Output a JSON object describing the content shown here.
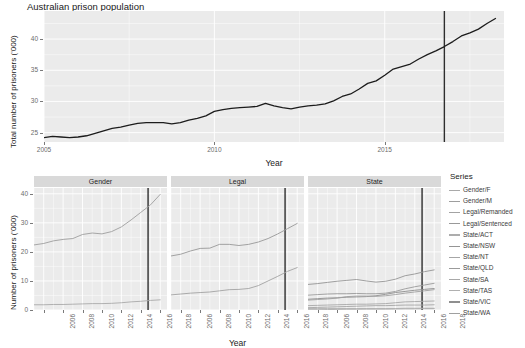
{
  "title": "Australian prison population",
  "top_chart": {
    "ylabel": "Total number of prisoners ('000)",
    "xlabel": "Year",
    "y_ticks": [
      "25",
      "30",
      "35",
      "40"
    ],
    "x_ticks": [
      "2005",
      "2010",
      "2015"
    ]
  },
  "facet_chart": {
    "ylabel": "Number of prisoners ('000)",
    "xlabel": "Year",
    "y_ticks": [
      "0",
      "10",
      "20",
      "30",
      "40"
    ],
    "x_ticks": [
      "2006",
      "2008",
      "2010",
      "2012",
      "2014",
      "2016",
      "2018"
    ],
    "strips": [
      "Gender",
      "Legal",
      "State"
    ]
  },
  "legend": {
    "title": "Series",
    "items": [
      {
        "label": "Gender/F",
        "color": "#a9a9a9"
      },
      {
        "label": "Gender/M",
        "color": "#9e9e9e"
      },
      {
        "label": "Legal/Remanded",
        "color": "#a3a3a3"
      },
      {
        "label": "Legal/Sentenced",
        "color": "#999999"
      },
      {
        "label": "State/ACT",
        "color": "#adadad"
      },
      {
        "label": "State/NSW",
        "color": "#959595"
      },
      {
        "label": "State/NT",
        "color": "#a6a6a6"
      },
      {
        "label": "State/QLD",
        "color": "#9b9b9b"
      },
      {
        "label": "State/SA",
        "color": "#a8a8a8"
      },
      {
        "label": "State/TAS",
        "color": "#b0b0b0"
      },
      {
        "label": "State/VIC",
        "color": "#8f8f8f"
      },
      {
        "label": "State/WA",
        "color": "#a0a0a0"
      }
    ]
  },
  "chart_data": {
    "type": "line",
    "title": "Australian prison population",
    "xlabel": "Year",
    "ylabel": "Total number of prisoners ('000)",
    "xlim": [
      2005.0,
      2018.5
    ],
    "ylim": [
      23.5,
      44.5
    ],
    "grid": true,
    "legend_position": "right",
    "panels": [
      {
        "name": "total",
        "role": "overview",
        "ylabel": "Total number of prisoners ('000)",
        "ylim": [
          23.5,
          44.5
        ],
        "y_ticks": [
          25,
          30,
          35,
          40
        ],
        "x_ticks": [
          2005,
          2010,
          2015
        ],
        "vline_x": 2016.75,
        "series": [
          {
            "name": "Total",
            "color": "#1c1c1c",
            "x": [
              2005.0,
              2005.25,
              2005.5,
              2005.75,
              2006.0,
              2006.25,
              2006.5,
              2006.75,
              2007.0,
              2007.25,
              2007.5,
              2007.75,
              2008.0,
              2008.25,
              2008.5,
              2008.75,
              2009.0,
              2009.25,
              2009.5,
              2009.75,
              2010.0,
              2010.25,
              2010.5,
              2010.75,
              2011.0,
              2011.25,
              2011.5,
              2011.75,
              2012.0,
              2012.25,
              2012.5,
              2012.75,
              2013.0,
              2013.25,
              2013.5,
              2013.75,
              2014.0,
              2014.25,
              2014.5,
              2014.75,
              2015.0,
              2015.25,
              2015.5,
              2015.75,
              2016.0,
              2016.25,
              2016.5,
              2016.75,
              2017.0,
              2017.25,
              2017.5,
              2017.75,
              2018.0,
              2018.25
            ],
            "y": [
              24.2,
              24.4,
              24.3,
              24.2,
              24.3,
              24.5,
              24.9,
              25.3,
              25.7,
              25.9,
              26.2,
              26.5,
              26.6,
              26.6,
              26.6,
              26.4,
              26.6,
              27.0,
              27.3,
              27.7,
              28.4,
              28.7,
              28.9,
              29.0,
              29.1,
              29.2,
              29.7,
              29.3,
              29.0,
              28.8,
              29.1,
              29.3,
              29.4,
              29.6,
              30.1,
              30.8,
              31.2,
              32.0,
              32.9,
              33.3,
              34.2,
              35.2,
              35.6,
              36.0,
              36.8,
              37.5,
              38.1,
              38.8,
              39.6,
              40.5,
              41.0,
              41.6,
              42.5,
              43.3
            ]
          }
        ]
      },
      {
        "name": "Gender",
        "ylim": [
          0,
          42
        ],
        "y_ticks": [
          0,
          10,
          20,
          30,
          40
        ],
        "x_ticks": [
          2006,
          2008,
          2010,
          2012,
          2014,
          2016,
          2018
        ],
        "vline_x": 2016.75,
        "series": [
          {
            "name": "Gender/M",
            "color": "#9e9e9e",
            "x": [
              2005,
              2006,
              2007,
              2008,
              2009,
              2010,
              2011,
              2012,
              2013,
              2014,
              2015,
              2016,
              2017,
              2018
            ],
            "y": [
              22.4,
              22.9,
              23.8,
              24.3,
              24.6,
              26.0,
              26.5,
              26.2,
              27.0,
              28.6,
              31.0,
              33.6,
              36.2,
              39.8
            ]
          },
          {
            "name": "Gender/F",
            "color": "#a9a9a9",
            "x": [
              2005,
              2006,
              2007,
              2008,
              2009,
              2010,
              2011,
              2012,
              2013,
              2014,
              2015,
              2016,
              2017,
              2018
            ],
            "y": [
              1.8,
              1.8,
              1.9,
              1.9,
              2.0,
              2.1,
              2.2,
              2.2,
              2.3,
              2.5,
              2.8,
              3.0,
              3.3,
              3.5
            ]
          }
        ]
      },
      {
        "name": "Legal",
        "ylim": [
          0,
          42
        ],
        "y_ticks": [
          0,
          10,
          20,
          30,
          40
        ],
        "x_ticks": [
          2006,
          2008,
          2010,
          2012,
          2014,
          2016,
          2018
        ],
        "vline_x": 2016.75,
        "series": [
          {
            "name": "Legal/Sentenced",
            "color": "#999999",
            "x": [
              2005,
              2006,
              2007,
              2008,
              2009,
              2010,
              2011,
              2012,
              2013,
              2014,
              2015,
              2016,
              2017,
              2018
            ],
            "y": [
              18.6,
              19.2,
              20.3,
              21.2,
              21.3,
              22.6,
              22.6,
              22.2,
              22.6,
              23.4,
              24.6,
              26.2,
              28.0,
              29.8
            ]
          },
          {
            "name": "Legal/Remanded",
            "color": "#a3a3a3",
            "x": [
              2005,
              2006,
              2007,
              2008,
              2009,
              2010,
              2011,
              2012,
              2013,
              2014,
              2015,
              2016,
              2017,
              2018
            ],
            "y": [
              5.2,
              5.5,
              5.8,
              6.0,
              6.2,
              6.6,
              7.0,
              7.1,
              7.4,
              8.4,
              10.0,
              11.6,
              13.3,
              14.6
            ]
          }
        ]
      },
      {
        "name": "State",
        "ylim": [
          0,
          42
        ],
        "y_ticks": [
          0,
          10,
          20,
          30,
          40
        ],
        "x_ticks": [
          2006,
          2008,
          2010,
          2012,
          2014,
          2016,
          2018
        ],
        "vline_x": 2016.75,
        "series": [
          {
            "name": "State/NSW",
            "color": "#959595",
            "x": [
              2005,
              2006,
              2007,
              2008,
              2009,
              2010,
              2011,
              2012,
              2013,
              2014,
              2015,
              2016,
              2017,
              2018
            ],
            "y": [
              8.8,
              9.1,
              9.5,
              9.9,
              10.2,
              10.5,
              10.0,
              9.6,
              9.9,
              10.6,
              11.8,
              12.4,
              13.2,
              13.8
            ]
          },
          {
            "name": "State/QLD",
            "color": "#9b9b9b",
            "x": [
              2005,
              2006,
              2007,
              2008,
              2009,
              2010,
              2011,
              2012,
              2013,
              2014,
              2015,
              2016,
              2017,
              2018
            ],
            "y": [
              5.1,
              5.3,
              5.5,
              5.6,
              5.6,
              5.7,
              5.6,
              5.6,
              5.8,
              6.4,
              7.3,
              8.0,
              8.6,
              9.2
            ]
          },
          {
            "name": "State/VIC",
            "color": "#8f8f8f",
            "x": [
              2005,
              2006,
              2007,
              2008,
              2009,
              2010,
              2011,
              2012,
              2013,
              2014,
              2015,
              2016,
              2017,
              2018
            ],
            "y": [
              3.7,
              3.9,
              4.1,
              4.2,
              4.4,
              4.5,
              4.6,
              4.9,
              5.4,
              6.0,
              6.4,
              6.8,
              7.1,
              7.4
            ]
          },
          {
            "name": "State/WA",
            "color": "#a0a0a0",
            "x": [
              2005,
              2006,
              2007,
              2008,
              2009,
              2010,
              2011,
              2012,
              2013,
              2014,
              2015,
              2016,
              2017,
              2018
            ],
            "y": [
              3.4,
              3.6,
              3.8,
              4.1,
              4.6,
              4.8,
              4.8,
              4.7,
              4.9,
              5.3,
              5.8,
              6.2,
              6.6,
              7.0
            ]
          },
          {
            "name": "State/SA",
            "color": "#a8a8a8",
            "x": [
              2005,
              2006,
              2007,
              2008,
              2009,
              2010,
              2011,
              2012,
              2013,
              2014,
              2015,
              2016,
              2017,
              2018
            ],
            "y": [
              1.5,
              1.6,
              1.7,
              1.8,
              1.9,
              2.0,
              2.0,
              2.1,
              2.2,
              2.5,
              2.8,
              2.9,
              3.0,
              3.1
            ]
          },
          {
            "name": "State/NT",
            "color": "#a6a6a6",
            "x": [
              2005,
              2006,
              2007,
              2008,
              2009,
              2010,
              2011,
              2012,
              2013,
              2014,
              2015,
              2016,
              2017,
              2018
            ],
            "y": [
              0.8,
              0.9,
              1.0,
              1.1,
              1.2,
              1.3,
              1.4,
              1.5,
              1.5,
              1.6,
              1.7,
              1.7,
              1.7,
              1.8
            ]
          },
          {
            "name": "State/TAS",
            "color": "#b0b0b0",
            "x": [
              2005,
              2006,
              2007,
              2008,
              2009,
              2010,
              2011,
              2012,
              2013,
              2014,
              2015,
              2016,
              2017,
              2018
            ],
            "y": [
              0.5,
              0.5,
              0.5,
              0.5,
              0.5,
              0.5,
              0.5,
              0.5,
              0.5,
              0.5,
              0.6,
              0.6,
              0.6,
              0.6
            ]
          },
          {
            "name": "State/ACT",
            "color": "#adadad",
            "x": [
              2005,
              2006,
              2007,
              2008,
              2009,
              2010,
              2011,
              2012,
              2013,
              2014,
              2015,
              2016,
              2017,
              2018
            ],
            "y": [
              0.1,
              0.1,
              0.15,
              0.2,
              0.25,
              0.25,
              0.3,
              0.3,
              0.3,
              0.35,
              0.4,
              0.4,
              0.45,
              0.45
            ]
          }
        ]
      }
    ]
  }
}
